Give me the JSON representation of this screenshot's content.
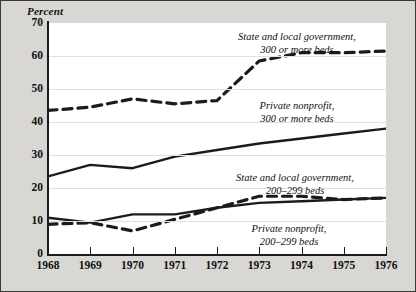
{
  "chart_data": {
    "type": "line",
    "title": "",
    "ylabel": "Percent",
    "xlabel": "",
    "ylim": [
      0,
      70
    ],
    "xlim": [
      1968,
      1976
    ],
    "grid": true,
    "legend_position": "inline-annotations",
    "x": [
      1968,
      1969,
      1970,
      1971,
      1972,
      1973,
      1974,
      1975,
      1976
    ],
    "y_ticks": [
      70,
      60,
      50,
      40,
      30,
      20,
      10,
      0
    ],
    "x_ticks": [
      "1968",
      "1969",
      "1970",
      "1971",
      "1972",
      "1973",
      "1974",
      "1975",
      "1976"
    ],
    "series": [
      {
        "name": "State and local government, 300 or more beds",
        "style": "dashed",
        "color": "#1b1b1b",
        "values": [
          43.5,
          44.5,
          47.0,
          45.5,
          46.5,
          58.5,
          61.0,
          61.0,
          61.5
        ]
      },
      {
        "name": "Private nonprofit, 300 or more beds",
        "style": "solid",
        "color": "#1b1b1b",
        "values": [
          23.5,
          27.0,
          26.0,
          29.5,
          31.5,
          33.5,
          35.0,
          36.5,
          38.0
        ]
      },
      {
        "name": "State and local government, 200-299 beds",
        "style": "dashed",
        "color": "#1b1b1b",
        "values": [
          9.0,
          9.5,
          7.0,
          10.5,
          14.0,
          17.5,
          17.5,
          16.5,
          17.0
        ]
      },
      {
        "name": "Private nonprofit, 200-299 beds",
        "style": "solid",
        "color": "#1b1b1b",
        "values": [
          11.0,
          9.5,
          12.0,
          12.0,
          14.0,
          15.5,
          16.0,
          16.5,
          17.0
        ]
      }
    ],
    "annotations": [
      {
        "id": "slg300",
        "line1": "State and local government,",
        "line2": "300 or more beds"
      },
      {
        "id": "pnp300",
        "line1": "Private nonprofit,",
        "line2": "300 or more beds"
      },
      {
        "id": "slg200",
        "line1": "State and local government,",
        "line2": "200–299 beds"
      },
      {
        "id": "pnp200",
        "line1": "Private nonprofit,",
        "line2": "200–299 beds"
      }
    ]
  },
  "colors": {
    "background": "#d9d7d3",
    "plot_background": "#ffffff",
    "ink": "#1b1b1b",
    "gridline": "#e2e0dd"
  }
}
